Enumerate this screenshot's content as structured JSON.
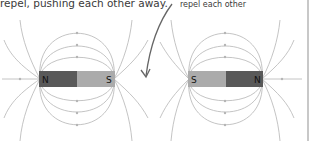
{
  "captions": {
    "main": "repel, pushing each other away.",
    "side": "repel each other"
  },
  "magnets": [
    {
      "left_pole": "N",
      "right_pole": "S",
      "left_color": "#595959",
      "right_color": "#ababab"
    },
    {
      "left_pole": "S",
      "right_pole": "N",
      "left_color": "#ababab",
      "right_color": "#595959"
    }
  ],
  "colors": {
    "field_line": "#b5b5b5",
    "arrow": "#666666",
    "text": "#3a3a3a",
    "border": "#c8c8c8"
  }
}
